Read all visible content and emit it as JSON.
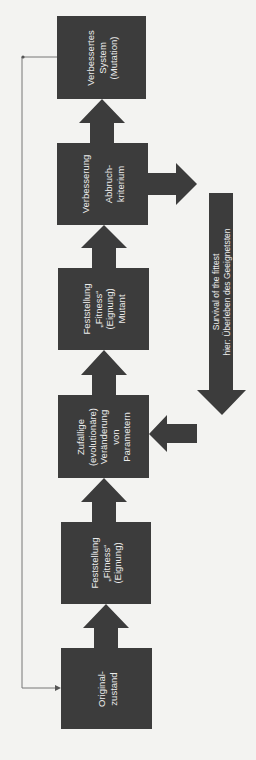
{
  "diagram": {
    "type": "flowchart",
    "orientation": "rotated-90-ccw",
    "colors": {
      "box": "#3c3c3c",
      "text": "#ececec",
      "background": "#f3f3f1",
      "line": "#777777"
    },
    "steps": [
      {
        "id": "s1",
        "label": "Original-\nzustand"
      },
      {
        "id": "s2",
        "label": "Feststellung\n„Fitness“\n(Eignung)"
      },
      {
        "id": "s3",
        "label": "Zufällige\n(evolutionäre)\nVeränderung\nvon\nParametern"
      },
      {
        "id": "s4",
        "label": "Feststellung\n„Fitness“\n(Eignung)\nMutant"
      },
      {
        "id": "s5",
        "label": "Verbesserung\n\nAbbruch-\nkriterium"
      },
      {
        "id": "s6",
        "label": "Verbessertes\nSystem\n(Mutation)"
      }
    ],
    "side_arrow": {
      "label": "Survival of the fittest\nhier: Überleben des Geeignetsten"
    },
    "edges": [
      {
        "from": "s1",
        "to": "s2"
      },
      {
        "from": "s2",
        "to": "s3"
      },
      {
        "from": "s3",
        "to": "s4"
      },
      {
        "from": "s4",
        "to": "s5"
      },
      {
        "from": "s5",
        "to": "s6"
      },
      {
        "from": "s5",
        "to": "side_arrow"
      },
      {
        "from": "side_arrow",
        "to": "s3"
      },
      {
        "from": "s6",
        "to": "s1",
        "style": "thin-feedback-line"
      }
    ]
  }
}
